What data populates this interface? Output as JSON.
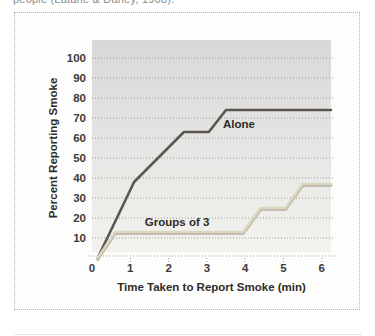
{
  "caption_top": "people (Latané & Darley, 1968).",
  "chart_data": {
    "type": "line",
    "title": "",
    "xlabel": "Time Taken to Report Smoke (min)",
    "ylabel": "Percent Reporting Smoke",
    "xlim": [
      0,
      6.3
    ],
    "ylim": [
      0,
      100
    ],
    "x_ticks": [
      0,
      1,
      2,
      3,
      4,
      5,
      6
    ],
    "y_ticks": [
      10,
      20,
      30,
      40,
      50,
      60,
      70,
      80,
      90,
      100
    ],
    "grid": "dotted-horizontal",
    "legend_position": "inline-labels",
    "series": [
      {
        "name": "Alone",
        "color": "#5c5551",
        "points": [
          [
            0.15,
            0
          ],
          [
            1.1,
            38
          ],
          [
            2.4,
            63
          ],
          [
            3.05,
            63
          ],
          [
            3.5,
            74
          ],
          [
            6.24,
            74
          ]
        ],
        "label": "Alone",
        "label_at": [
          3.42,
          65
        ],
        "label_anchor": "start"
      },
      {
        "name": "Groups of 3",
        "color": "#ddd7c0",
        "shadow_color": "#b5b1a3",
        "points": [
          [
            0.15,
            0
          ],
          [
            0.6,
            13
          ],
          [
            3.95,
            13
          ],
          [
            4.4,
            25
          ],
          [
            5.05,
            25
          ],
          [
            5.5,
            37
          ],
          [
            6.24,
            37
          ]
        ],
        "label": "Groups of 3",
        "label_at": [
          1.38,
          16
        ],
        "label_anchor": "start"
      }
    ]
  },
  "colors": {
    "figure_border": "#b6b6b6",
    "plot_gradient_top": "#d8d8d7",
    "plot_gradient_bottom": "#f2f2ef",
    "gridline": "#9c9c9c",
    "tick_label": "#3d3a38",
    "axis_title": "#2e2b29",
    "caption": "#8b8b8b"
  }
}
